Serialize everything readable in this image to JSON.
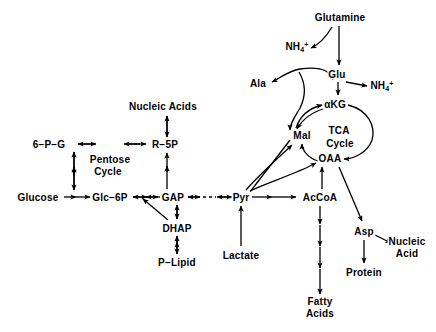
{
  "diagram": {
    "stroke_color": "#000000",
    "background_color": "#ffffff",
    "width": 436,
    "height": 332,
    "nodes": [
      {
        "id": "glucose",
        "label": "Glucose",
        "x": 38,
        "y": 197
      },
      {
        "id": "glc6p",
        "label": "Glc−6P",
        "x": 110,
        "y": 197
      },
      {
        "id": "6pg",
        "label": "6−P−G",
        "x": 49,
        "y": 144
      },
      {
        "id": "pentose",
        "label": "Pentose",
        "x": 110,
        "y": 159
      },
      {
        "id": "cycle",
        "label": "Cycle",
        "x": 108,
        "y": 171
      },
      {
        "id": "r5p",
        "label": "R−5P",
        "x": 165,
        "y": 144
      },
      {
        "id": "nucleic_acids",
        "label": "Nucleic Acids",
        "x": 163,
        "y": 106
      },
      {
        "id": "gap",
        "label": "GAP",
        "x": 173,
        "y": 197
      },
      {
        "id": "dhap",
        "label": "DHAP",
        "x": 177,
        "y": 228
      },
      {
        "id": "plipid",
        "label": "P−Lipid",
        "x": 177,
        "y": 262
      },
      {
        "id": "pyr",
        "label": "Pyr",
        "x": 241,
        "y": 197
      },
      {
        "id": "lactate",
        "label": "Lactate",
        "x": 241,
        "y": 255
      },
      {
        "id": "accoa",
        "label": "AcCoA",
        "x": 320,
        "y": 197
      },
      {
        "id": "fatty_acids",
        "label": "Fatty\nAcids",
        "x": 320,
        "y": 307
      },
      {
        "id": "asp",
        "label": "Asp",
        "x": 364,
        "y": 231
      },
      {
        "id": "protein",
        "label": "Protein",
        "x": 364,
        "y": 272
      },
      {
        "id": "nucleic_acid",
        "label": "Nucleic\nAcid",
        "x": 407,
        "y": 247
      },
      {
        "id": "oaa",
        "label": "OAA",
        "x": 330,
        "y": 158
      },
      {
        "id": "mal",
        "label": "Mal",
        "x": 302,
        "y": 135
      },
      {
        "id": "akg",
        "label": "αKG",
        "x": 335,
        "y": 104
      },
      {
        "id": "tca",
        "label": "TCA",
        "x": 339,
        "y": 130
      },
      {
        "id": "tca_cycle",
        "label": "Cycle",
        "x": 340,
        "y": 143
      },
      {
        "id": "glu",
        "label": "Glu",
        "x": 337,
        "y": 74
      },
      {
        "id": "glutamine",
        "label": "Glutamine",
        "x": 340,
        "y": 17
      },
      {
        "id": "ala",
        "label": "Ala",
        "x": 258,
        "y": 83
      },
      {
        "id": "nh4_left",
        "label": "NH",
        "sub": "4",
        "sup": "+",
        "x": 297,
        "y": 47
      },
      {
        "id": "nh4_right",
        "label": "NH",
        "sub": "4",
        "sup": "+",
        "x": 382,
        "y": 86
      }
    ],
    "edges": [
      {
        "from": "glucose",
        "to": "glc6p",
        "style": "double-arrow"
      },
      {
        "from": "glc6p",
        "to": "6pg",
        "style": "double-arrow-vertical"
      },
      {
        "from": "6pg",
        "to": "r5p",
        "style": "double-arrow"
      },
      {
        "from": "r5p",
        "to": "nucleic_acids",
        "style": "double-arrow-vertical"
      },
      {
        "from": "gap",
        "to": "r5p",
        "style": "double-arrow-vertical"
      },
      {
        "from": "glc6p",
        "to": "gap",
        "style": "double-arrow"
      },
      {
        "from": "gap",
        "to": "pyr",
        "style": "dashed-double-arrow"
      },
      {
        "from": "gap",
        "to": "dhap",
        "style": "double-arrow-vertical"
      },
      {
        "from": "dhap",
        "to": "plipid",
        "style": "double-arrow-vertical"
      },
      {
        "from": "dhap",
        "to": "glc6p",
        "style": "diagonal-arrow"
      },
      {
        "from": "lactate",
        "to": "pyr",
        "style": "arrow-up"
      },
      {
        "from": "pyr",
        "to": "accoa",
        "style": "double-arrow"
      },
      {
        "from": "pyr",
        "to": "mal",
        "style": "curved-arrow"
      },
      {
        "from": "pyr",
        "to": "oaa",
        "style": "curved-arrow"
      },
      {
        "from": "accoa",
        "to": "oaa",
        "style": "arrow-up"
      },
      {
        "from": "accoa",
        "to": "fatty_acids",
        "style": "multi-arrow-down"
      },
      {
        "from": "oaa",
        "to": "asp",
        "style": "diagonal-arrow"
      },
      {
        "from": "asp",
        "to": "protein",
        "style": "arrow-down"
      },
      {
        "from": "asp",
        "to": "nucleic_acid",
        "style": "diagonal-arrow"
      },
      {
        "from": "glutamine",
        "to": "glu",
        "style": "arrow-down"
      },
      {
        "from": "glutamine",
        "to": "nh4_left",
        "style": "curved-arrow"
      },
      {
        "from": "glu",
        "to": "akg",
        "style": "arrow-down"
      },
      {
        "from": "glu",
        "to": "nh4_right",
        "style": "arrow-right"
      },
      {
        "from": "glu",
        "to": "ala",
        "style": "curved-arrow"
      },
      {
        "from": "akg",
        "to": "mal",
        "style": "tca-loop-left"
      },
      {
        "from": "akg",
        "to": "oaa",
        "style": "tca-loop-right"
      },
      {
        "from": "mal",
        "to": "akg",
        "style": "tca-inner-arc"
      },
      {
        "from": "oaa",
        "to": "mal",
        "style": "tca-inner-arc"
      }
    ]
  }
}
